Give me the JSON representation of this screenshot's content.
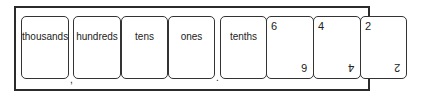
{
  "place_value_chart": {
    "columns": [
      {
        "label": "thousands"
      },
      {
        "label": "hundreds"
      },
      {
        "label": "tens"
      },
      {
        "label": "ones"
      },
      {
        "label": "tenths"
      }
    ],
    "separators": {
      "thousands_comma": ",",
      "decimal_point": "."
    }
  },
  "digit_cards": [
    {
      "digit": "6"
    },
    {
      "digit": "4"
    },
    {
      "digit": "2"
    }
  ]
}
